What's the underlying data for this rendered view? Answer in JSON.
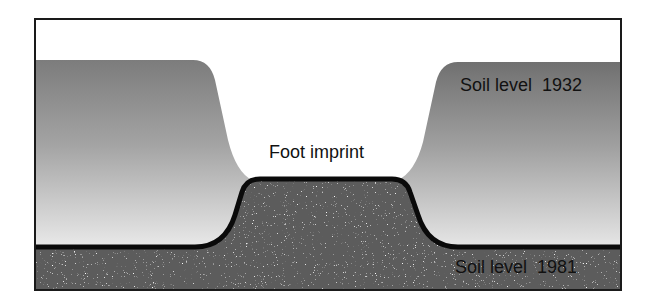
{
  "diagram": {
    "labels": {
      "foot_imprint": "Foot imprint",
      "soil_level_old": "Soil level  1932",
      "soil_level_new": "Soil level  1981"
    },
    "regions": [
      {
        "name": "soil-1932-layer",
        "description": "Eroded soil above 1981 level, grey gradient"
      },
      {
        "name": "soil-1981-layer",
        "description": "Current soil, dark speckled"
      },
      {
        "name": "foot-imprint-gap",
        "description": "White depression where footprint compacted soil"
      }
    ],
    "colors": {
      "frame": "#1a1a1a",
      "soil_1932_top": "#7a7a7a",
      "soil_1932_bottom": "#e6e6e6",
      "soil_1981": "#5a5a5a",
      "boundary_line": "#0a0a0a",
      "background": "#ffffff"
    }
  }
}
